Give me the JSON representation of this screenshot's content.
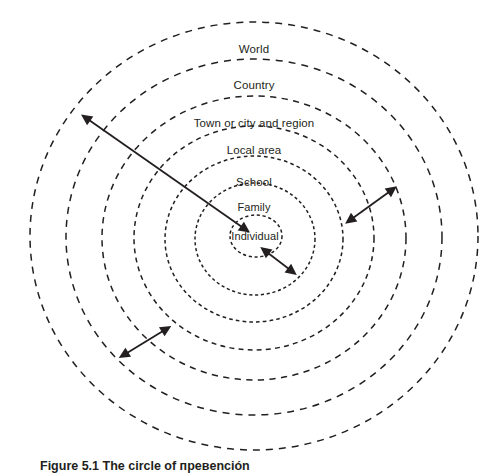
{
  "figure": {
    "background_color": "#ffffff",
    "stroke_color": "#231f20",
    "text_color": "#231f20",
    "caption": "Figure 5.1 The circle of превención",
    "center": {
      "x": 254,
      "y": 236
    }
  },
  "rings": [
    {
      "id": "world",
      "label": "World",
      "label_x": 254,
      "label_y": 43,
      "rx": 224,
      "ry": 214,
      "cx": 254,
      "cy": 236
    },
    {
      "id": "country",
      "label": "Country",
      "label_x": 254,
      "label_y": 79,
      "rx": 188,
      "ry": 178,
      "cx": 254,
      "cy": 237
    },
    {
      "id": "town-or-city-and-region",
      "label": "Town or city and region",
      "label_x": 254,
      "label_y": 117,
      "rx": 152,
      "ry": 142,
      "cx": 254,
      "cy": 238
    },
    {
      "id": "local-area",
      "label": "Local area",
      "label_x": 254,
      "label_y": 144,
      "rx": 120,
      "ry": 112,
      "cx": 254,
      "cy": 238
    },
    {
      "id": "school",
      "label": "School",
      "label_x": 254,
      "label_y": 176,
      "rx": 89,
      "ry": 83,
      "cx": 254,
      "cy": 239
    },
    {
      "id": "family",
      "label": "Family",
      "label_x": 254,
      "label_y": 201,
      "rx": 60,
      "ry": 56,
      "cx": 255,
      "cy": 239
    },
    {
      "id": "individual",
      "label": "Individual",
      "label_x": 255,
      "label_y": 230,
      "rx": 26,
      "ry": 21,
      "cx": 256,
      "cy": 236
    }
  ],
  "arrows": [
    {
      "id": "long-outward-arrow",
      "description": "double-headed arrow from the Individual centre out to the World ring, pointing up-left",
      "x1": 242,
      "y1": 227,
      "x2": 89,
      "y2": 120
    },
    {
      "id": "right-gap-arrow",
      "description": "short double-headed arrow spanning the gap between two rings on the right",
      "x1": 353,
      "y1": 218,
      "x2": 389,
      "y2": 192
    },
    {
      "id": "lower-left-gap-arrow",
      "description": "short double-headed arrow spanning the gap between two rings at lower left",
      "x1": 127,
      "y1": 353,
      "x2": 163,
      "y2": 331
    },
    {
      "id": "inner-gap-arrow",
      "description": "very short double-headed arrow spanning the gap between the innermost rings",
      "x1": 268,
      "y1": 253,
      "x2": 289,
      "y2": 269
    }
  ],
  "style": {
    "ring_stroke_width": 1.5,
    "ring_dash": "7 6",
    "arrow_stroke_width": 1.8
  }
}
